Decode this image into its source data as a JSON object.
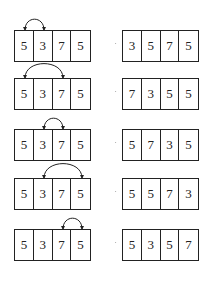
{
  "diagram": {
    "rows": [
      {
        "before": [
          "5",
          "3",
          "7",
          "5"
        ],
        "after": [
          "3",
          "5",
          "7",
          "5"
        ],
        "swap": [
          0,
          1
        ],
        "top": 30
      },
      {
        "before": [
          "5",
          "3",
          "7",
          "5"
        ],
        "after": [
          "7",
          "3",
          "5",
          "5"
        ],
        "swap": [
          0,
          2
        ],
        "top": 78
      },
      {
        "before": [
          "5",
          "3",
          "7",
          "5"
        ],
        "after": [
          "5",
          "7",
          "3",
          "5"
        ],
        "swap": [
          1,
          2
        ],
        "top": 129
      },
      {
        "before": [
          "5",
          "3",
          "7",
          "5"
        ],
        "after": [
          "5",
          "5",
          "7",
          "3"
        ],
        "swap": [
          1,
          3
        ],
        "top": 178
      },
      {
        "before": [
          "5",
          "3",
          "7",
          "5"
        ],
        "after": [
          "5",
          "3",
          "5",
          "7"
        ],
        "swap": [
          2,
          3
        ],
        "top": 229
      }
    ]
  }
}
